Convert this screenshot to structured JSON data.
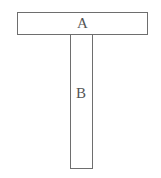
{
  "diagram": {
    "shapes": [
      {
        "id": "A",
        "label": "A",
        "type": "rectangle",
        "orientation": "horizontal",
        "x": 17,
        "y": 12,
        "width": 131,
        "height": 23
      },
      {
        "id": "B",
        "label": "B",
        "type": "rectangle",
        "orientation": "vertical",
        "x": 70,
        "y": 34,
        "width": 23,
        "height": 135
      }
    ],
    "colors": {
      "stroke": "#6e6e6e",
      "text": "#555555",
      "background": "#ffffff"
    }
  },
  "labels": {
    "a": "A",
    "b": "B"
  }
}
